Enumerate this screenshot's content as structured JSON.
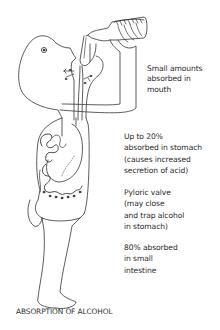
{
  "diagram": {
    "title": "ABSORPTION OF ALCOHOL",
    "annotations": [
      {
        "id": "mouth",
        "lines": [
          "Small amounts",
          "absorbed in",
          "mouth"
        ]
      },
      {
        "id": "stomach",
        "lines": [
          "Up to 20%",
          "absorbed in stomach",
          "(causes increased",
          "secretion of acid)"
        ]
      },
      {
        "id": "pyloric",
        "lines": [
          "Pyloric valve",
          "(may close",
          "and trap alcohol",
          "in stomach)"
        ]
      },
      {
        "id": "intestine",
        "lines": [
          "80% absorbed",
          "in small",
          "intestine"
        ]
      }
    ],
    "icons": [
      "bottle-icon",
      "head-icon",
      "esophagus-icon",
      "stomach-icon",
      "small-intestine-icon",
      "absorption-arrow-icon"
    ],
    "colors": {
      "line": "#333333",
      "text": "#2a2a2a",
      "background": "#ffffff"
    }
  }
}
